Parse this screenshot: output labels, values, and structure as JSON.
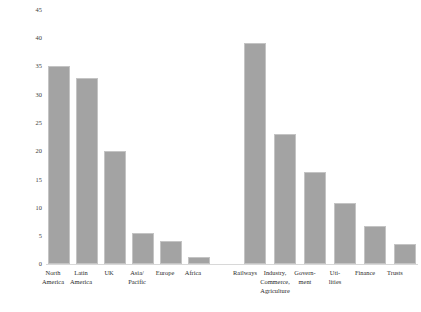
{
  "chart_data": {
    "type": "bar",
    "title": "",
    "xlabel": "",
    "ylabel": "Portfolio Share in percent (× 100)",
    "ylim": [
      0,
      45
    ],
    "yticks": [
      0,
      5,
      10,
      15,
      20,
      25,
      30,
      35,
      40,
      45
    ],
    "grid": false,
    "legend": "none",
    "bar_color": "#a3a3a3",
    "bar_edge_color": "#c4c4c4",
    "groups": [
      {
        "name": "By region",
        "categories": [
          "North America",
          "Latin America",
          "UK",
          "Asia/ Pacific",
          "Europe",
          "Africa"
        ],
        "values": [
          35.1,
          33.0,
          20.0,
          5.5,
          4.0,
          1.3
        ]
      },
      {
        "name": "By sector",
        "categories": [
          "Railways",
          "Industry, Commerce, Agriculture",
          "Govern- ment",
          "Uti- lities",
          "Finance",
          "Trusts"
        ],
        "values": [
          39.1,
          23.0,
          16.3,
          10.8,
          6.7,
          3.5
        ]
      }
    ],
    "categories": [
      "North America",
      "Latin America",
      "UK",
      "Asia/ Pacific",
      "Europe",
      "Africa",
      "Railways",
      "Industry, Commerce, Agriculture",
      "Govern- ment",
      "Uti- lities",
      "Finance",
      "Trusts"
    ],
    "values": [
      35.1,
      33.0,
      20.0,
      5.5,
      4.0,
      1.3,
      39.1,
      23.0,
      16.3,
      10.8,
      6.7,
      3.5
    ]
  },
  "axis": {
    "y_title": "Portfolio Share in percent (× 100)",
    "ticks": [
      {
        "label": "45"
      },
      {
        "label": "40"
      },
      {
        "label": "35"
      },
      {
        "label": "30"
      },
      {
        "label": "25"
      },
      {
        "label": "20"
      },
      {
        "label": "15"
      },
      {
        "label": "10"
      },
      {
        "label": "5"
      },
      {
        "label": "0"
      }
    ]
  },
  "labels": {
    "left": [
      {
        "line1": "North",
        "line2": "America"
      },
      {
        "line1": "Latin",
        "line2": "America"
      },
      {
        "line1": "UK",
        "line2": ""
      },
      {
        "line1": "Asia/",
        "line2": "Pacific"
      },
      {
        "line1": "Europe",
        "line2": ""
      },
      {
        "line1": "Africa",
        "line2": ""
      }
    ],
    "right": [
      {
        "line1": "Railways",
        "line2": "",
        "line3": ""
      },
      {
        "line1": "Industry,",
        "line2": "Commerce,",
        "line3": "Agriculture"
      },
      {
        "line1": "Govern-",
        "line2": "ment",
        "line3": ""
      },
      {
        "line1": "Uti-",
        "line2": "lities",
        "line3": ""
      },
      {
        "line1": "Finance",
        "line2": "",
        "line3": ""
      },
      {
        "line1": "Trusts",
        "line2": "",
        "line3": ""
      }
    ]
  }
}
